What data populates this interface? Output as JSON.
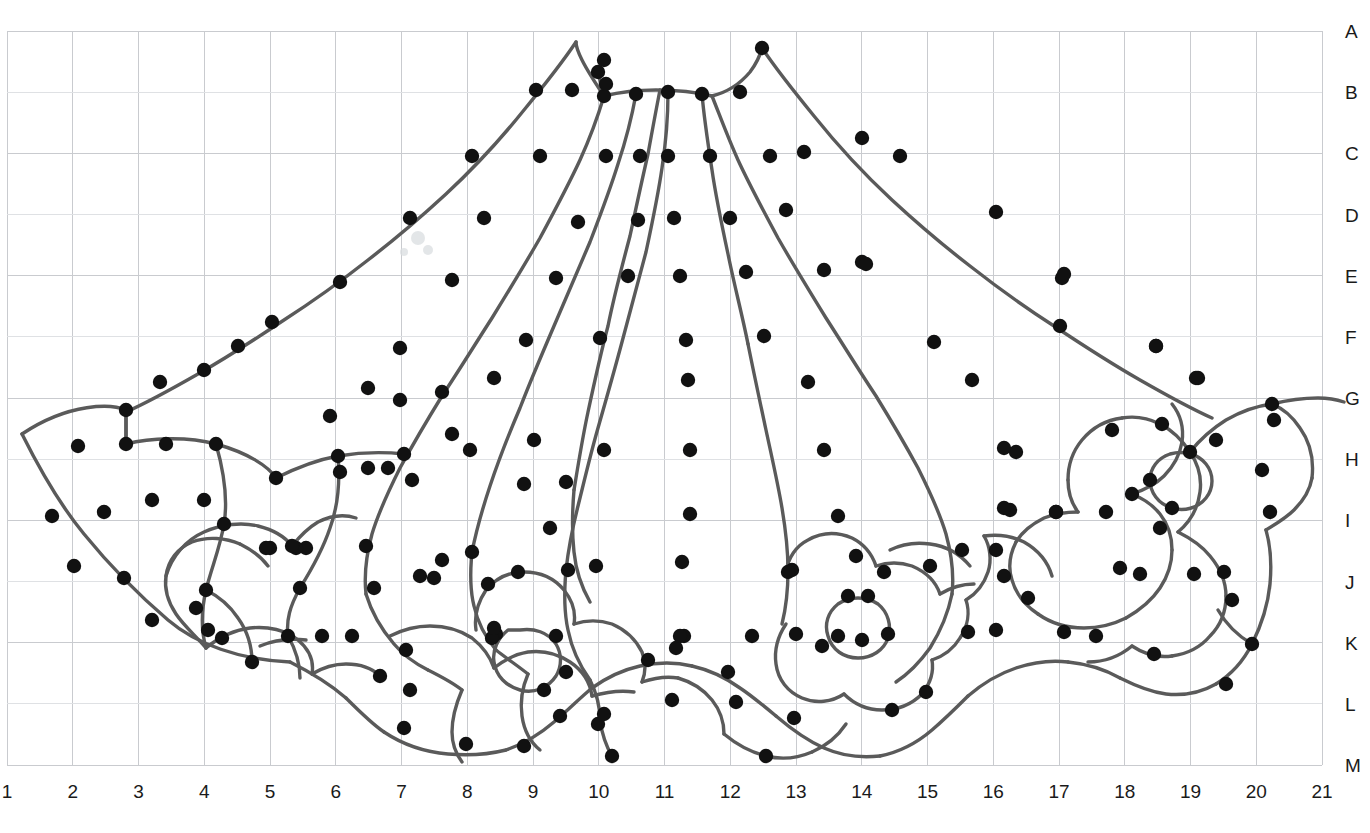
{
  "document": {
    "type": "lace-pattern-grid",
    "title": "Lace pattern working diagram",
    "description": "Fan / skirt shaped lace pattern with radiating pleat lines and floral motifs laid over a lettered-and-numbered working grid."
  },
  "grid": {
    "columns": 20,
    "rows": 12,
    "left": 7,
    "top": 31,
    "right": 1322,
    "bottom": 765,
    "cell_width": 65.75,
    "cell_height": 61.17,
    "line_color": "#c9cbcf",
    "faint_line_color": "#dfe1e4",
    "column_labels": [
      "1",
      "2",
      "3",
      "4",
      "5",
      "6",
      "7",
      "8",
      "9",
      "10",
      "11",
      "12",
      "13",
      "14",
      "15",
      "16",
      "17",
      "18",
      "19",
      "20",
      "21"
    ],
    "row_labels": [
      "A",
      "B",
      "C",
      "D",
      "E",
      "F",
      "G",
      "H",
      "I",
      "J",
      "K",
      "L",
      "M"
    ]
  },
  "style": {
    "stroke_color": "#5a5a5a",
    "stroke_width": 3.4,
    "dot_color": "#111111",
    "dot_radius": 7.2,
    "background": "#ffffff",
    "label_color": "#1a1a1a",
    "label_size_px": 19
  },
  "chart_data": {
    "type": "scatter",
    "xlabel": "",
    "ylabel": "",
    "grid": true,
    "legend": null,
    "x_tick_labels": [
      "1",
      "2",
      "3",
      "4",
      "5",
      "6",
      "7",
      "8",
      "9",
      "10",
      "11",
      "12",
      "13",
      "14",
      "15",
      "16",
      "17",
      "18",
      "19",
      "20",
      "21"
    ],
    "y_tick_labels": [
      "A",
      "B",
      "C",
      "D",
      "E",
      "F",
      "G",
      "H",
      "I",
      "J",
      "K",
      "L",
      "M"
    ],
    "paths": [
      "M 22 434 C 70 402 112 404 126 410 L 126 444",
      "M 22 434 C 40 470 60 505 84 534 C 110 566 140 596 168 620 C 196 644 240 660 290 662",
      "M 126 444 C 150 438 186 436 216 444 C 248 453 268 466 276 478",
      "M 126 410 C 126 424 126 436 126 446",
      "M 216 444 C 224 472 228 500 224 524 C 220 548 212 566 206 590 C 200 616 202 634 206 648",
      "M 276 478 C 296 468 316 460 338 456 C 362 452 386 452 404 454",
      "M 338 456 C 340 480 338 506 330 528 C 322 552 310 572 300 588 C 290 606 286 620 288 636",
      "M 206 648 C 196 636 184 626 176 614 C 168 602 164 590 166 576 C 168 560 178 548 192 542 C 208 536 226 538 240 544",
      "M 240 544 C 252 550 262 558 268 566",
      "M 166 576 C 172 556 186 540 204 532 C 222 524 242 522 258 526 C 274 530 286 538 292 546",
      "M 292 546 C 300 536 308 528 318 522 C 330 516 344 514 356 518",
      "M 206 590 C 218 596 230 606 238 618 C 248 632 252 648 252 662",
      "M 206 648 C 218 638 234 630 250 628 C 268 626 286 630 298 640 C 310 650 314 662 312 674",
      "M 312 674 C 322 668 334 664 346 664 C 360 664 372 668 380 676",
      "M 288 636 C 296 650 300 664 300 678",
      "M 290 662 C 310 672 330 684 346 698",
      "M 346 698 C 360 712 372 724 384 732",
      "M 384 732 C 402 744 424 752 448 754 C 470 756 490 754 506 750",
      "M 506 750 C 524 744 540 734 554 722 C 568 710 580 698 592 688",
      "M 592 688 C 606 678 622 670 640 666 C 658 662 676 662 692 666",
      "M 692 666 C 710 670 726 678 740 688 C 752 696 764 706 776 716",
      "M 776 716 C 790 728 806 740 824 748 C 842 756 862 758 880 756",
      "M 880 756 C 900 752 918 742 932 730 C 946 718 958 706 968 696",
      "M 968 696 C 982 684 998 674 1016 668 C 1034 662 1052 660 1068 662",
      "M 1068 662 C 1088 664 1106 670 1120 678",
      "M 1120 678 C 1136 686 1150 692 1166 694 C 1184 696 1202 692 1216 684",
      "M 1216 684 C 1232 674 1244 660 1252 644",
      "M 1252 644 C 1262 624 1268 604 1270 584 C 1272 562 1270 544 1266 530",
      "M 1266 530 C 1276 524 1286 518 1294 510 C 1304 500 1310 490 1312 478",
      "M 1312 478 C 1314 460 1310 442 1300 428 C 1292 416 1282 408 1272 404",
      "M 1272 404 C 1288 400 1304 398 1318 398 C 1330 398 1338 400 1344 402",
      "M 1272 404 C 1256 406 1240 412 1226 420 C 1210 430 1198 442 1190 452",
      "M 1190 452 C 1182 440 1172 430 1160 424 C 1148 418 1134 416 1122 418",
      "M 1122 418 C 1106 420 1092 428 1082 440 C 1072 452 1068 466 1068 480",
      "M 1068 480 C 1068 492 1072 504 1078 512",
      "M 1078 512 C 1066 512 1054 514 1044 518 C 1032 524 1022 532 1016 542",
      "M 1016 542 C 1010 554 1008 568 1012 580 C 1016 594 1026 606 1038 614",
      "M 1038 614 C 1052 624 1068 628 1084 628 C 1100 628 1114 624 1126 618",
      "M 1126 618 C 1140 610 1152 600 1160 588 C 1168 576 1172 562 1172 550",
      "M 1172 550 C 1172 536 1168 524 1160 514 C 1152 504 1142 498 1132 494",
      "M 1132 494 C 1144 490 1156 484 1164 476 C 1174 466 1180 454 1182 442",
      "M 1182 442 C 1184 428 1180 414 1172 404",
      "M 1150 480 C 1150 468 1158 458 1170 454 C 1184 450 1198 454 1206 464 C 1214 474 1214 488 1206 498 C 1198 508 1184 512 1172 508 C 1158 504 1150 492 1150 480 Z",
      "M 1190 452 C 1198 464 1202 478 1200 492 C 1198 508 1190 522 1178 532",
      "M 1178 532 C 1190 538 1202 546 1210 556 C 1220 568 1226 582 1226 596",
      "M 1226 596 C 1226 612 1220 626 1210 636 C 1200 648 1186 654 1172 656",
      "M 1172 656 C 1158 658 1144 654 1132 646",
      "M 1132 646 C 1120 656 1104 662 1088 662",
      "M 1252 644 C 1238 636 1226 624 1218 610",
      "M 598 72 C 600 80 602 88 604 96",
      "M 604 96 C 620 92 638 90 656 90 C 676 90 696 92 712 96",
      "M 712 96 C 728 92 740 84 750 72 C 756 64 760 56 762 48",
      "M 604 96 C 596 84 588 72 582 60 C 578 52 576 46 576 42",
      "M 576 42 C 560 66 542 88 524 110 C 500 140 474 168 446 194 C 420 218 394 240 368 260 C 340 282 312 302 284 320 C 254 340 226 358 198 374 C 170 390 144 404 126 412",
      "M 604 96 C 598 116 590 138 580 160 C 568 186 554 212 540 238 C 524 266 508 292 492 318 C 474 346 458 372 442 396 C 426 422 412 446 400 468 C 388 492 378 514 372 534 C 366 556 364 576 366 594",
      "M 636 94 C 632 116 626 140 618 164 C 610 190 600 216 590 242 C 578 270 566 298 554 326 C 542 354 530 382 520 408 C 508 436 498 462 490 486 C 482 510 476 532 472 552",
      "M 668 92 C 668 116 666 142 662 168 C 658 196 652 224 646 252 C 638 282 630 312 622 342 C 614 372 606 400 598 428 C 590 456 584 482 578 506 C 572 530 568 552 566 570",
      "M 702 94 C 704 118 708 144 712 170 C 716 198 722 226 728 254 C 734 284 742 314 748 344",
      "M 712 96 C 720 116 728 138 738 160 C 750 186 764 212 778 238 C 794 266 810 292 826 318 C 844 346 860 372 876 396 C 892 422 906 446 918 468 C 930 492 940 514 946 534 C 952 556 954 576 952 594",
      "M 762 48 C 778 72 796 94 814 116 C 838 146 864 174 892 200 C 918 224 944 246 970 266 C 998 288 1026 308 1054 326 C 1084 346 1112 364 1140 380 C 1168 396 1194 410 1212 418",
      "M 660 90 C 656 110 652 132 648 154 C 642 180 636 208 630 236 C 622 266 614 296 608 326 C 600 356 594 384 588 412 C 582 440 578 466 574 490",
      "M 574 490 C 572 514 572 534 574 552 C 576 572 582 588 590 602",
      "M 366 594 C 372 614 382 630 394 644 C 404 656 416 664 428 670",
      "M 472 552 C 470 572 470 590 474 606 C 478 624 486 638 496 650",
      "M 566 570 C 564 592 564 612 568 630 C 572 650 580 666 590 680",
      "M 952 594 C 948 614 940 632 930 648 C 920 662 908 674 896 682",
      "M 748 344 C 754 374 760 402 766 430 C 772 458 778 484 782 508 C 786 532 788 552 788 570",
      "M 788 570 C 788 590 786 608 782 624",
      "M 428 670 C 440 676 452 682 462 690",
      "M 462 690 C 456 704 452 718 452 732 C 452 744 456 754 462 762",
      "M 496 650 C 506 658 518 666 528 674",
      "M 528 674 C 522 688 520 702 522 716 C 524 730 530 742 540 750",
      "M 590 680 C 596 692 600 706 600 720",
      "M 600 720 C 602 734 606 746 612 756",
      "M 390 636 C 402 630 416 626 430 626 C 446 626 460 630 472 638 C 482 646 490 656 494 668",
      "M 494 668 C 504 660 516 654 528 652 C 544 650 558 654 570 662 C 582 670 590 682 592 696",
      "M 476 630 C 474 616 478 602 486 590 C 496 578 510 572 524 572 C 540 572 554 578 564 590 C 572 600 576 612 574 624",
      "M 574 624 C 586 620 600 620 612 624 C 626 630 636 640 642 652 C 646 662 646 672 642 682",
      "M 508 630 C 498 638 492 650 494 662 C 496 676 506 686 520 690 C 534 694 548 688 556 676 C 562 666 562 654 556 644 C 548 632 534 628 520 630 C 516 630 512 630 508 630 Z",
      "M 786 572 C 788 558 796 546 808 540 C 822 532 838 532 852 538 C 864 544 872 554 876 566",
      "M 876 566 C 888 562 900 562 912 566 C 926 572 936 582 940 594",
      "M 838 604 C 828 612 824 624 828 636 C 832 650 844 658 858 658 C 872 658 884 650 888 638 C 892 626 888 612 878 604 C 866 596 850 596 838 604 Z",
      "M 786 624 C 778 636 774 650 776 664 C 778 680 788 692 802 698 C 816 704 832 702 844 694",
      "M 844 694 C 854 704 868 710 882 710 C 898 710 912 704 922 694 C 930 684 934 672 932 660",
      "M 932 660 C 944 656 954 648 960 638 C 968 626 970 612 966 600",
      "M 966 600 C 976 594 984 584 988 572 C 992 560 990 546 984 536",
      "M 984 536 C 998 534 1012 536 1024 542 C 1038 550 1048 562 1052 576",
      "M 940 594 C 950 588 962 584 974 584",
      "M 890 550 C 902 544 916 542 930 544 C 946 546 960 554 970 566",
      "M 592 696 C 606 692 620 690 634 692",
      "M 642 682 C 654 678 666 676 678 678",
      "M 678 678 C 692 682 704 690 712 700 C 720 710 724 722 724 734",
      "M 724 734 C 736 744 750 752 766 756 C 782 760 798 758 812 752",
      "M 812 752 C 826 746 838 736 846 724",
      "M 260 646 C 274 640 290 638 306 640"
    ],
    "pins": [
      [
        78,
        446
      ],
      [
        126,
        410
      ],
      [
        126,
        444
      ],
      [
        166,
        444
      ],
      [
        216,
        444
      ],
      [
        276,
        478
      ],
      [
        338,
        456
      ],
      [
        404,
        454
      ],
      [
        470,
        450
      ],
      [
        52,
        516
      ],
      [
        104,
        512
      ],
      [
        152,
        500
      ],
      [
        204,
        500
      ],
      [
        224,
        524
      ],
      [
        270,
        548
      ],
      [
        306,
        548
      ],
      [
        340,
        472
      ],
      [
        368,
        468
      ],
      [
        74,
        566
      ],
      [
        124,
        578
      ],
      [
        206,
        590
      ],
      [
        208,
        630
      ],
      [
        266,
        548
      ],
      [
        296,
        548
      ],
      [
        300,
        588
      ],
      [
        152,
        620
      ],
      [
        196,
        608
      ],
      [
        222,
        638
      ],
      [
        252,
        662
      ],
      [
        288,
        636
      ],
      [
        292,
        546
      ],
      [
        322,
        636
      ],
      [
        352,
        636
      ],
      [
        380,
        676
      ],
      [
        406,
        650
      ],
      [
        404,
        728
      ],
      [
        410,
        690
      ],
      [
        434,
        578
      ],
      [
        466,
        744
      ],
      [
        496,
        634
      ],
      [
        492,
        638
      ],
      [
        524,
        746
      ],
      [
        544,
        690
      ],
      [
        556,
        636
      ],
      [
        560,
        716
      ],
      [
        566,
        672
      ],
      [
        598,
        724
      ],
      [
        604,
        714
      ],
      [
        612,
        756
      ],
      [
        648,
        660
      ],
      [
        672,
        700
      ],
      [
        676,
        648
      ],
      [
        684,
        636
      ],
      [
        728,
        672
      ],
      [
        736,
        702
      ],
      [
        766,
        756
      ],
      [
        796,
        634
      ],
      [
        792,
        570
      ],
      [
        794,
        718
      ],
      [
        822,
        646
      ],
      [
        838,
        636
      ],
      [
        848,
        596
      ],
      [
        862,
        640
      ],
      [
        868,
        596
      ],
      [
        888,
        634
      ],
      [
        884,
        572
      ],
      [
        892,
        710
      ],
      [
        926,
        692
      ],
      [
        930,
        566
      ],
      [
        962,
        550
      ],
      [
        968,
        632
      ],
      [
        996,
        630
      ],
      [
        1004,
        576
      ],
      [
        1010,
        510
      ],
      [
        1016,
        452
      ],
      [
        1028,
        598
      ],
      [
        1056,
        512
      ],
      [
        1064,
        632
      ],
      [
        1062,
        278
      ],
      [
        1096,
        636
      ],
      [
        1106,
        512
      ],
      [
        1120,
        568
      ],
      [
        1132,
        494
      ],
      [
        1140,
        574
      ],
      [
        1150,
        480
      ],
      [
        1154,
        654
      ],
      [
        1156,
        346
      ],
      [
        1160,
        528
      ],
      [
        1162,
        424
      ],
      [
        1172,
        508
      ],
      [
        1190,
        452
      ],
      [
        1194,
        574
      ],
      [
        1198,
        378
      ],
      [
        1216,
        440
      ],
      [
        1224,
        572
      ],
      [
        1226,
        684
      ],
      [
        1232,
        600
      ],
      [
        1252,
        644
      ],
      [
        1262,
        470
      ],
      [
        1270,
        512
      ],
      [
        1272,
        404
      ],
      [
        1274,
        420
      ],
      [
        598,
        72
      ],
      [
        604,
        96
      ],
      [
        636,
        94
      ],
      [
        668,
        92
      ],
      [
        702,
        94
      ],
      [
        740,
        92
      ],
      [
        762,
        48
      ],
      [
        572,
        90
      ],
      [
        536,
        90
      ],
      [
        606,
        84
      ],
      [
        604,
        60
      ],
      [
        862,
        138
      ],
      [
        900,
        156
      ],
      [
        472,
        156
      ],
      [
        540,
        156
      ],
      [
        606,
        156
      ],
      [
        640,
        156
      ],
      [
        668,
        156
      ],
      [
        710,
        156
      ],
      [
        770,
        156
      ],
      [
        804,
        152
      ],
      [
        410,
        218
      ],
      [
        484,
        218
      ],
      [
        578,
        222
      ],
      [
        638,
        220
      ],
      [
        674,
        218
      ],
      [
        730,
        218
      ],
      [
        786,
        210
      ],
      [
        862,
        262
      ],
      [
        996,
        212
      ],
      [
        340,
        282
      ],
      [
        452,
        280
      ],
      [
        556,
        278
      ],
      [
        628,
        276
      ],
      [
        680,
        276
      ],
      [
        746,
        272
      ],
      [
        824,
        270
      ],
      [
        866,
        264
      ],
      [
        1064,
        274
      ],
      [
        272,
        322
      ],
      [
        400,
        348
      ],
      [
        526,
        340
      ],
      [
        600,
        338
      ],
      [
        686,
        340
      ],
      [
        764,
        336
      ],
      [
        934,
        342
      ],
      [
        1060,
        326
      ],
      [
        1156,
        346
      ],
      [
        238,
        346
      ],
      [
        204,
        370
      ],
      [
        160,
        382
      ],
      [
        368,
        388
      ],
      [
        442,
        392
      ],
      [
        494,
        378
      ],
      [
        688,
        380
      ],
      [
        808,
        382
      ],
      [
        972,
        380
      ],
      [
        1196,
        378
      ],
      [
        400,
        400
      ],
      [
        330,
        416
      ],
      [
        452,
        434
      ],
      [
        534,
        440
      ],
      [
        604,
        450
      ],
      [
        690,
        450
      ],
      [
        824,
        450
      ],
      [
        1004,
        448
      ],
      [
        1112,
        430
      ],
      [
        388,
        468
      ],
      [
        412,
        480
      ],
      [
        524,
        484
      ],
      [
        566,
        482
      ],
      [
        690,
        514
      ],
      [
        838,
        516
      ],
      [
        1004,
        508
      ],
      [
        1056,
        512
      ],
      [
        366,
        546
      ],
      [
        374,
        588
      ],
      [
        420,
        576
      ],
      [
        442,
        560
      ],
      [
        472,
        552
      ],
      [
        550,
        528
      ],
      [
        596,
        566
      ],
      [
        682,
        562
      ],
      [
        856,
        556
      ],
      [
        996,
        550
      ],
      [
        488,
        584
      ],
      [
        494,
        628
      ],
      [
        518,
        572
      ],
      [
        568,
        570
      ],
      [
        680,
        636
      ],
      [
        752,
        636
      ],
      [
        788,
        572
      ]
    ]
  },
  "specks": [
    {
      "x": 418,
      "y": 238,
      "r": 7
    },
    {
      "x": 428,
      "y": 250,
      "r": 5
    },
    {
      "x": 404,
      "y": 252,
      "r": 4
    }
  ]
}
